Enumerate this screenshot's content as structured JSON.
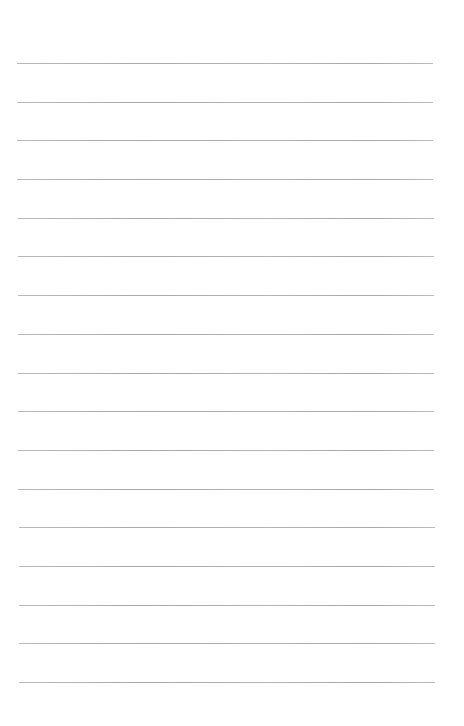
{
  "document": {
    "type": "ruled-paper",
    "ruled_line_count": 17,
    "line_color": "#ababab",
    "paper_color": "#ffffff",
    "text_content": []
  }
}
